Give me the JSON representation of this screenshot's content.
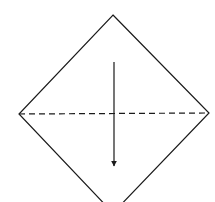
{
  "diagram": {
    "type": "origami-fold-step",
    "canvas": {
      "width": 215,
      "height": 202,
      "background": "#ffffff"
    },
    "stroke_color": "#1a1a1a",
    "paper": {
      "shape": "square-rotated-45",
      "vertices": {
        "top": [
          113,
          15
        ],
        "right": [
          209,
          113
        ],
        "bottom": [
          113,
          213
        ],
        "left": [
          19,
          114
        ]
      },
      "note": "bottom vertex extends beyond visible canvas"
    },
    "fold_line": {
      "style": "dashed",
      "kind": "valley-fold",
      "from": [
        19,
        114
      ],
      "to": [
        209,
        113
      ]
    },
    "fold_arrow": {
      "direction": "down",
      "from": [
        114,
        62
      ],
      "to": [
        114,
        166
      ]
    }
  }
}
